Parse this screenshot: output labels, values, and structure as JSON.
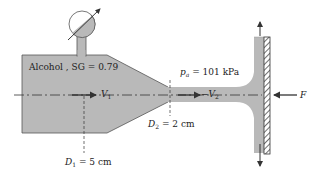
{
  "diagram": {
    "type": "fluid-jet-impinging-plate",
    "colors": {
      "fluid": "#b9b9b9",
      "outline": "#555555",
      "line": "#333333",
      "background": "#ffffff"
    },
    "labels": {
      "fluid": "Alcohol , SG = 0.79",
      "pressure_symbol": "p",
      "pressure_sub": "a",
      "pressure_value": " = 101 kPa",
      "v1_symbol": "V",
      "v1_sub": "1",
      "v2_prefix": "−",
      "v2_symbol": "V",
      "v2_sub": "2",
      "d1_symbol": "D",
      "d1_sub": "1",
      "d1_value": " = 5 cm",
      "d2_symbol": "D",
      "d2_sub": "2",
      "d2_value": " = 2 cm",
      "force": "F"
    },
    "components": [
      "pressure-gauge",
      "tank",
      "nozzle",
      "jet",
      "plate",
      "force-arrow",
      "outflow-arrows"
    ]
  }
}
